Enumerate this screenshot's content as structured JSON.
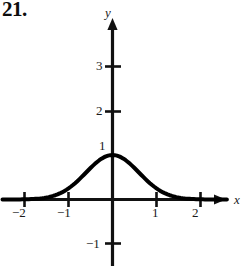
{
  "exercise": {
    "number": "21."
  },
  "figure": {
    "axes": {
      "x_label": "x",
      "y_label": "y"
    },
    "x_ticks": [
      {
        "value": -2,
        "label": "−2"
      },
      {
        "value": -1,
        "label": "−1"
      },
      {
        "value": 1,
        "label": "1"
      },
      {
        "value": 2,
        "label": "2"
      }
    ],
    "y_ticks": [
      {
        "value": 3,
        "label": "3"
      },
      {
        "value": 2,
        "label": "2"
      },
      {
        "value": 1,
        "label": "1"
      },
      {
        "value": -1,
        "label": "−1"
      }
    ],
    "colors": {
      "curve": "#000000",
      "axis": "#111111",
      "text": "#1a1a1a",
      "background": "#ffffff"
    }
  },
  "chart_data": {
    "type": "line",
    "title": "",
    "xlabel": "x",
    "ylabel": "y",
    "xlim": [
      -2.5,
      2.6
    ],
    "ylim": [
      -1.4,
      3.6
    ],
    "xticks": [
      -2,
      -1,
      1,
      2
    ],
    "yticks": [
      -1,
      1,
      2,
      3
    ],
    "grid": false,
    "legend": null,
    "series": [
      {
        "name": "bell curve",
        "x": [
          -2.5,
          -2.25,
          -2.0,
          -1.75,
          -1.5,
          -1.25,
          -1.0,
          -0.75,
          -0.5,
          -0.25,
          0.0,
          0.25,
          0.5,
          0.75,
          1.0,
          1.25,
          1.5,
          1.75,
          2.0,
          2.25,
          2.5
        ],
        "y": [
          0.002,
          0.006,
          0.018,
          0.046,
          0.105,
          0.21,
          0.368,
          0.57,
          0.779,
          0.939,
          1.0,
          0.939,
          0.779,
          0.57,
          0.368,
          0.21,
          0.105,
          0.046,
          0.018,
          0.006,
          0.002
        ]
      }
    ],
    "annotations": []
  }
}
